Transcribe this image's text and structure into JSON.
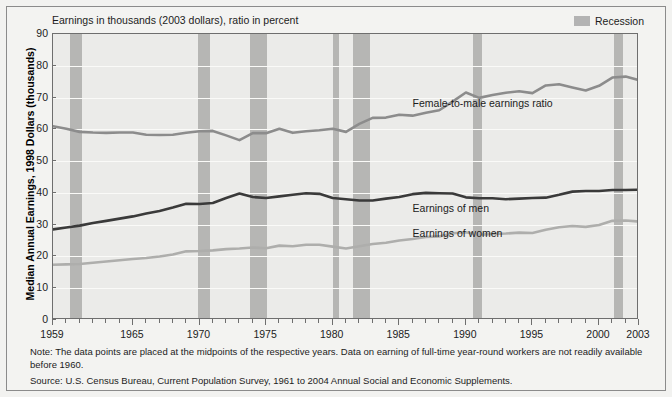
{
  "figure": {
    "subtitle": "Earnings in thousands (2003 dollars), ratio in percent",
    "yaxis_title": "Median Annual Earnings, 1998 Dollars (thousands)",
    "legend": {
      "recession_label": "Recession",
      "recession_color": "#b6b6b4"
    },
    "series_labels": {
      "ratio": "Female-to-male earnings ratio",
      "men": "Earnings of men",
      "women": "Earnings of women"
    },
    "note": "Note: The data points are placed at the midpoints of the respective years. Data on earning of full-time year-round workers are not readily available before 1960.",
    "source": "Source: U.S. Census Bureau, Current Population Survey, 1961 to 2004 Annual Social and Economic Supplements."
  },
  "chart_data": {
    "type": "line",
    "title": "",
    "subtitle": "Earnings in thousands (2003 dollars), ratio in percent",
    "xlabel": "",
    "ylabel": "Median Annual Earnings, 1998 Dollars (thousands)",
    "xlim": [
      1959,
      2003
    ],
    "ylim": [
      0,
      90
    ],
    "yticks": [
      0,
      10,
      20,
      30,
      40,
      50,
      60,
      70,
      80,
      90
    ],
    "xticks": [
      1959,
      1965,
      1970,
      1975,
      1980,
      1985,
      1990,
      1995,
      2000,
      2003
    ],
    "grid": true,
    "legend_position": "in-plot annotations",
    "x": [
      1959,
      1960,
      1961,
      1962,
      1963,
      1964,
      1965,
      1966,
      1967,
      1968,
      1969,
      1970,
      1971,
      1972,
      1973,
      1974,
      1975,
      1976,
      1977,
      1978,
      1979,
      1980,
      1981,
      1982,
      1983,
      1984,
      1985,
      1986,
      1987,
      1988,
      1989,
      1990,
      1991,
      1992,
      1993,
      1994,
      1995,
      1996,
      1997,
      1998,
      1999,
      2000,
      2001,
      2002,
      2003
    ],
    "series": [
      {
        "name": "Female-to-male earnings ratio",
        "color": "#8c8c8c",
        "unit": "percent",
        "values": [
          61.0,
          60.2,
          59.2,
          59.0,
          58.9,
          59.0,
          59.0,
          58.3,
          58.2,
          58.3,
          58.9,
          59.4,
          59.5,
          58.1,
          56.6,
          58.8,
          58.8,
          60.2,
          58.9,
          59.4,
          59.7,
          60.2,
          59.2,
          61.7,
          63.6,
          63.7,
          64.6,
          64.3,
          65.2,
          66.0,
          68.7,
          71.6,
          69.9,
          70.8,
          71.5,
          72.0,
          71.4,
          73.8,
          74.2,
          73.2,
          72.2,
          73.7,
          76.3,
          76.6,
          75.5
        ]
      },
      {
        "name": "Earnings of men",
        "color": "#3a3a3a",
        "unit": "thousands of 2003 dollars",
        "values": [
          28.5,
          29.1,
          29.7,
          30.5,
          31.2,
          31.9,
          32.6,
          33.5,
          34.3,
          35.4,
          36.6,
          36.5,
          36.8,
          38.4,
          39.8,
          38.7,
          38.4,
          38.9,
          39.4,
          39.9,
          39.7,
          38.4,
          38.0,
          37.6,
          37.6,
          38.2,
          38.7,
          39.6,
          40.0,
          39.9,
          39.8,
          38.6,
          38.3,
          38.3,
          38.0,
          38.2,
          38.4,
          38.5,
          39.4,
          40.4,
          40.6,
          40.6,
          40.9,
          40.9,
          41.0
        ]
      },
      {
        "name": "Earnings of women",
        "color": "#aeaeac",
        "unit": "thousands of 2003 dollars",
        "values": [
          17.4,
          17.5,
          17.6,
          18.0,
          18.4,
          18.8,
          19.2,
          19.5,
          20.0,
          20.6,
          21.6,
          21.7,
          21.9,
          22.3,
          22.5,
          22.8,
          22.6,
          23.4,
          23.2,
          23.7,
          23.7,
          23.1,
          22.5,
          23.2,
          23.9,
          24.3,
          25.0,
          25.5,
          26.1,
          26.3,
          27.3,
          27.6,
          26.8,
          27.1,
          27.2,
          27.5,
          27.4,
          28.4,
          29.2,
          29.6,
          29.3,
          29.9,
          31.2,
          31.3,
          31.0
        ]
      }
    ],
    "recession_bands": [
      {
        "start": 1960.3,
        "end": 1961.2
      },
      {
        "start": 1969.9,
        "end": 1970.8
      },
      {
        "start": 1973.8,
        "end": 1975.1
      },
      {
        "start": 1980.0,
        "end": 1980.5
      },
      {
        "start": 1981.5,
        "end": 1982.8
      },
      {
        "start": 1990.5,
        "end": 1991.2
      },
      {
        "start": 2001.1,
        "end": 2001.8
      }
    ]
  }
}
